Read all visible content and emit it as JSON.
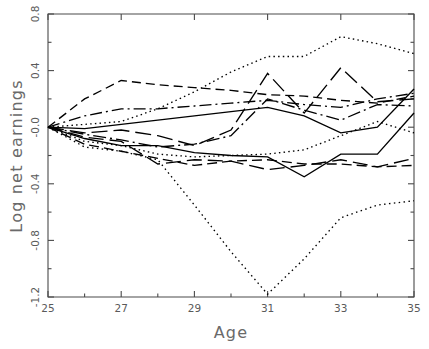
{
  "chart_data": {
    "type": "line",
    "title": "",
    "subtitle": "",
    "xlabel": "Age",
    "ylabel": "Log net earnings",
    "xlim": [
      25,
      35
    ],
    "ylim": [
      -1.2,
      0.8
    ],
    "xticks": [
      25,
      27,
      29,
      31,
      33,
      35
    ],
    "xtick_labels": [
      "25",
      "27",
      "29",
      "31",
      "33",
      "35"
    ],
    "xminor_ticks": [
      26,
      28,
      30,
      32,
      34
    ],
    "yticks": [
      0.8,
      0.4,
      0.0,
      -0.4,
      -0.8,
      -1.2
    ],
    "ytick_labels": [
      "0.8",
      "0.4",
      "-0.0",
      "-0.4",
      "-0.8",
      "-1.2"
    ],
    "grid": false,
    "legend": "none",
    "x": [
      25,
      26,
      27,
      28,
      29,
      30,
      31,
      32,
      33,
      34,
      35
    ],
    "series": [
      {
        "name": "series-1-dotted-high",
        "style": "dotted",
        "dash": "1.5,3.2",
        "width": 1.5,
        "values": [
          0.0,
          0.02,
          0.04,
          0.13,
          0.25,
          0.39,
          0.5,
          0.5,
          0.64,
          0.59,
          0.52
        ]
      },
      {
        "name": "series-2-dashed-upper",
        "style": "dashed",
        "dash": "9,5",
        "width": 1.4,
        "values": [
          0.0,
          0.2,
          0.33,
          0.3,
          0.28,
          0.26,
          0.23,
          0.22,
          0.19,
          0.17,
          0.22
        ]
      },
      {
        "name": "series-3-dashdot",
        "style": "dash-dot",
        "dash": "12,4,2,4",
        "width": 1.4,
        "values": [
          0.0,
          0.08,
          0.13,
          0.13,
          0.15,
          0.17,
          0.19,
          0.16,
          0.14,
          0.2,
          0.24
        ]
      },
      {
        "name": "series-4-solid-thin",
        "style": "solid",
        "dash": "none",
        "width": 1.1,
        "values": [
          0.0,
          -0.01,
          0.02,
          0.05,
          0.08,
          0.11,
          0.14,
          0.08,
          -0.04,
          0.0,
          0.27
        ]
      },
      {
        "name": "series-5-longdash",
        "style": "long-dash",
        "dash": "16,6",
        "width": 1.5,
        "values": [
          0.0,
          -0.04,
          -0.02,
          -0.06,
          -0.13,
          -0.02,
          0.38,
          0.1,
          0.42,
          0.18,
          0.2
        ]
      },
      {
        "name": "series-6-dashdot-mid",
        "style": "dash-dot",
        "dash": "13,4,2,4",
        "width": 1.5,
        "values": [
          0.0,
          -0.05,
          -0.09,
          -0.14,
          -0.12,
          -0.06,
          0.2,
          0.12,
          0.05,
          0.16,
          0.15
        ]
      },
      {
        "name": "series-7-dotted-mid",
        "style": "dotted",
        "dash": "1.5,3.2",
        "width": 1.6,
        "values": [
          0.0,
          -0.1,
          -0.13,
          -0.19,
          -0.21,
          -0.2,
          -0.19,
          -0.16,
          -0.06,
          0.04,
          -0.04
        ]
      },
      {
        "name": "series-8-solid-thick",
        "style": "solid",
        "dash": "none",
        "width": 1.7,
        "values": [
          0.0,
          -0.08,
          -0.13,
          -0.13,
          -0.18,
          -0.2,
          -0.21,
          -0.35,
          -0.19,
          -0.19,
          0.1
        ]
      },
      {
        "name": "series-9-longdash-low",
        "style": "long-dash",
        "dash": "15,6",
        "width": 1.6,
        "values": [
          0.0,
          -0.07,
          -0.1,
          -0.26,
          -0.23,
          -0.24,
          -0.3,
          -0.27,
          -0.23,
          -0.28,
          -0.22
        ]
      },
      {
        "name": "series-10-dashed-low",
        "style": "dashed",
        "dash": "10,5",
        "width": 1.5,
        "values": [
          0.0,
          -0.12,
          -0.17,
          -0.22,
          -0.27,
          -0.24,
          -0.23,
          -0.26,
          -0.26,
          -0.28,
          -0.27
        ]
      },
      {
        "name": "series-11-dotted-deep-dip",
        "style": "dotted",
        "dash": "1.5,3.4",
        "width": 1.6,
        "values": [
          0.0,
          -0.14,
          -0.17,
          -0.23,
          -0.55,
          -0.88,
          -1.18,
          -0.93,
          -0.64,
          -0.55,
          -0.52
        ]
      }
    ]
  }
}
